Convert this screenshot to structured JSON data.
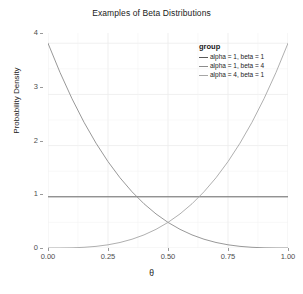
{
  "chart_data": {
    "type": "line",
    "title": "Examples of Beta Distributions",
    "xlabel": "θ",
    "ylabel": "Probability Density",
    "xlim": [
      0,
      1
    ],
    "ylim": [
      0,
      4.2
    ],
    "grid": true,
    "legend_position": "inside-top-right",
    "legend_title": "group",
    "xticks": [
      "0.00",
      "0.25",
      "0.50",
      "0.75",
      "1.00"
    ],
    "xtick_values": [
      0,
      0.25,
      0.5,
      0.75,
      1
    ],
    "yticks": [
      "0",
      "1",
      "2",
      "3",
      "4"
    ],
    "ytick_values": [
      0,
      1,
      2,
      3,
      4
    ],
    "x": [
      0,
      0.05,
      0.1,
      0.15,
      0.2,
      0.25,
      0.3,
      0.35,
      0.4,
      0.45,
      0.5,
      0.55,
      0.6,
      0.65,
      0.7,
      0.75,
      0.8,
      0.85,
      0.9,
      0.95,
      1
    ],
    "series": [
      {
        "name": "alpha = 1, beta = 1",
        "color": "#595959",
        "values": [
          1,
          1,
          1,
          1,
          1,
          1,
          1,
          1,
          1,
          1,
          1,
          1,
          1,
          1,
          1,
          1,
          1,
          1,
          1,
          1,
          1
        ]
      },
      {
        "name": "alpha = 1, beta = 4",
        "color": "#8c8c8c",
        "values": [
          4,
          3.4295,
          2.916,
          2.4565,
          2.048,
          1.6875,
          1.372,
          1.0985,
          0.864,
          0.6655,
          0.5,
          0.3645,
          0.256,
          0.1715,
          0.108,
          0.0625,
          0.032,
          0.0135,
          0.004,
          0.0005,
          0
        ]
      },
      {
        "name": "alpha = 4, beta = 1",
        "color": "#a6a6a6",
        "values": [
          0,
          0.0005,
          0.004,
          0.0135,
          0.032,
          0.0625,
          0.108,
          0.1715,
          0.256,
          0.3645,
          0.5,
          0.6655,
          0.864,
          1.0985,
          1.372,
          1.6875,
          2.048,
          2.4565,
          2.916,
          3.4295,
          4
        ]
      }
    ]
  },
  "style": {
    "panel_background": "#ffffff",
    "grid_color": "#ebebeb",
    "axis_text_color": "#4d4d4d",
    "title_color": "#1a1a1a",
    "tick_color": "#9a9a9a"
  }
}
